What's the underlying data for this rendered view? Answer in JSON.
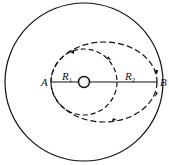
{
  "diagram": {
    "type": "orbital-transfer",
    "labels": {
      "point_a": "A",
      "point_b": "B",
      "r1": "R",
      "r1_sub": "1",
      "r2": "R",
      "r2_sub": "2"
    },
    "elements": {
      "outer_circle": "orbit of radius R2 (solid)",
      "inner_circle": "orbit of radius R1 (dashed)",
      "transfer_ellipse": "elliptical transfer orbit from A to B (dashed)",
      "central_body": "planet at center"
    },
    "colors": {
      "stroke": "#111111",
      "background": "#ffffff"
    }
  }
}
